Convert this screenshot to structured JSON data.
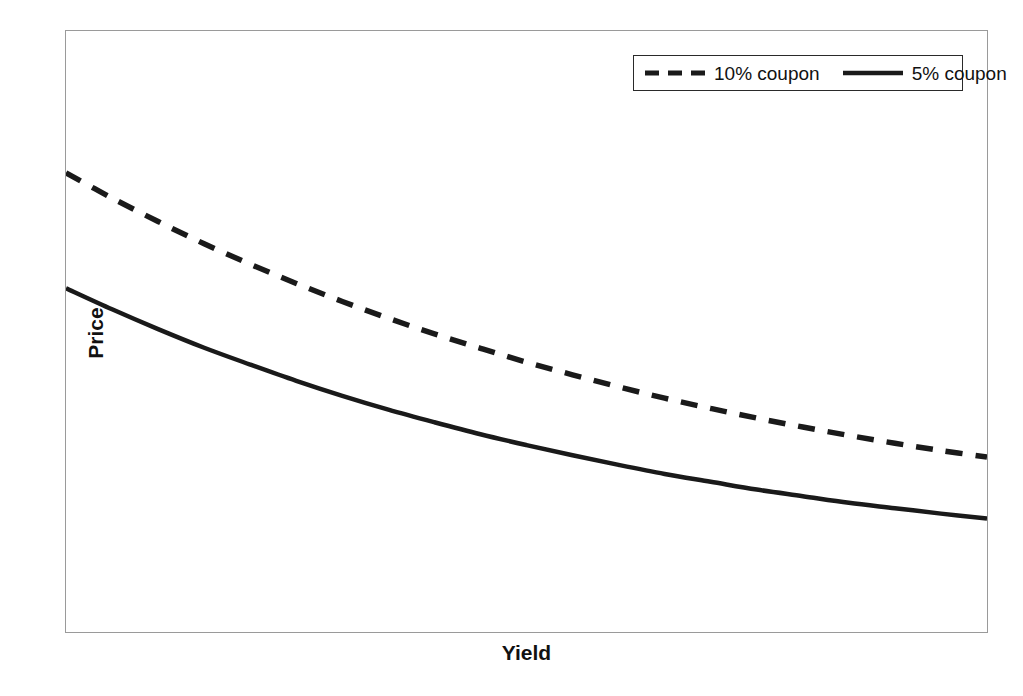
{
  "chart_data": {
    "type": "line",
    "title": "",
    "subtitle": "",
    "xlabel": "Yield",
    "ylabel": "Price",
    "grid": false,
    "legend_position": "top-right",
    "xlim": [
      0,
      100
    ],
    "ylim": [
      0,
      100
    ],
    "x_tick_labels": [],
    "y_tick_labels": [],
    "annotations": [],
    "series": [
      {
        "name": "10% coupon",
        "style": "dashed",
        "color": "#1a1a1a",
        "x": [
          0,
          5,
          10,
          15,
          20,
          25,
          30,
          35,
          40,
          45,
          50,
          55,
          60,
          65,
          70,
          75,
          80,
          85,
          90,
          95,
          100
        ],
        "y": [
          76.4,
          72.2,
          68.3,
          64.6,
          61.2,
          58.0,
          55.0,
          52.2,
          49.6,
          47.2,
          44.9,
          42.8,
          40.8,
          38.9,
          37.2,
          35.6,
          34.1,
          32.7,
          31.4,
          30.2,
          29.1
        ]
      },
      {
        "name": "5% coupon",
        "style": "solid",
        "color": "#1a1a1a",
        "x": [
          0,
          5,
          10,
          15,
          20,
          25,
          30,
          35,
          40,
          45,
          50,
          55,
          60,
          65,
          70,
          75,
          80,
          85,
          90,
          95,
          100
        ],
        "y": [
          57.2,
          53.7,
          50.4,
          47.3,
          44.5,
          41.8,
          39.3,
          37.0,
          34.9,
          32.9,
          31.1,
          29.4,
          27.8,
          26.3,
          25.0,
          23.7,
          22.6,
          21.5,
          20.6,
          19.7,
          18.9
        ]
      }
    ]
  },
  "legend": {
    "entries": [
      {
        "label": "10% coupon",
        "style": "dashed"
      },
      {
        "label": "5% coupon",
        "style": "solid"
      }
    ]
  },
  "axes": {
    "y_title": "Price",
    "x_title": "Yield"
  },
  "colors": {
    "line": "#1a1a1a",
    "frame": "#9a9a9a",
    "legend_border": "#2a2a2a",
    "background": "#ffffff"
  }
}
